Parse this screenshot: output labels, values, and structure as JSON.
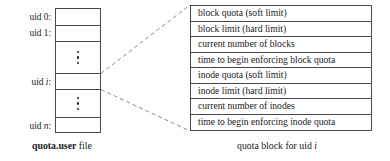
{
  "diagram": {
    "left_table": {
      "name": "quota.user file",
      "caption_bold": "quota.user",
      "caption_rest": " file",
      "rows": [
        {
          "label_prefix": "uid ",
          "label_index": "0",
          "label_suffix": ":",
          "index_italic": false,
          "type": "entry"
        },
        {
          "label_prefix": "uid ",
          "label_index": "1",
          "label_suffix": ":",
          "index_italic": false,
          "type": "entry"
        },
        {
          "label_prefix": "",
          "label_index": "",
          "label_suffix": "",
          "index_italic": false,
          "type": "ellipsis"
        },
        {
          "label_prefix": "uid ",
          "label_index": "i",
          "label_suffix": ":",
          "index_italic": true,
          "type": "entry"
        },
        {
          "label_prefix": "",
          "label_index": "",
          "label_suffix": "",
          "index_italic": false,
          "type": "ellipsis"
        },
        {
          "label_prefix": "uid ",
          "label_index": "n",
          "label_suffix": ":",
          "index_italic": true,
          "type": "entry"
        }
      ]
    },
    "right_table": {
      "name": "quota block for uid i",
      "caption_prefix": "quota block for uid ",
      "caption_italic": "i",
      "fields": [
        "block quota (soft limit)",
        "block limit (hard limit)",
        "current number of blocks",
        "time to begin enforcing block quota",
        "inode quota (soft limit)",
        "inode limit (hard limit)",
        "current number of inodes",
        "time to begin enforcing inode quota"
      ]
    },
    "connectors": {
      "style": "dashed",
      "color": "#8c8c8c",
      "description": "two dashed lines linking the uid i entry to the quota block"
    },
    "colors": {
      "background": "#ffffff",
      "line": "#4a4a4a",
      "text": "#1a1a1a",
      "dashed": "#8c8c8c"
    }
  }
}
